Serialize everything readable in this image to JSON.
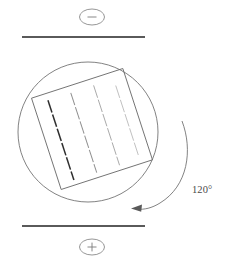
{
  "figure": {
    "background_color": "#ffffff",
    "width": 229,
    "height": 266
  },
  "electrodes": {
    "top": {
      "label": "negative-electrode",
      "terminal_symbol": "–",
      "terminal_symbol_name": "minus-sign",
      "plate_color": "#5a5a5a",
      "plate": {
        "x1": 22,
        "y1": 37,
        "x2": 145,
        "y2": 37
      },
      "terminal": {
        "cx": 92,
        "cy": 17,
        "rx": 12.5,
        "ry": 8
      }
    },
    "bottom": {
      "label": "positive-electrode",
      "terminal_symbol": "+",
      "terminal_symbol_name": "plus-sign",
      "plate_color": "#5a5a5a",
      "plate": {
        "x1": 22,
        "y1": 226,
        "x2": 145,
        "y2": 226
      },
      "terminal": {
        "cx": 92,
        "cy": 247,
        "rx": 12.5,
        "ry": 8
      }
    }
  },
  "cell": {
    "label": "cell-circle",
    "cx": 88,
    "cy": 132,
    "r": 70,
    "stroke_color": "#6b6b6b"
  },
  "sample": {
    "label": "rotated-sample-square",
    "cx": 92,
    "cy": 129,
    "size": 96,
    "rotation_deg": -18,
    "stroke_color": "#6b6b6b"
  },
  "director_field": {
    "label": "director-dashes",
    "column_count": 4,
    "dashes_per_column": 6,
    "columns": [
      {
        "index": 0,
        "color": "#2e2e2e",
        "width": 1.5
      },
      {
        "index": 1,
        "color": "#8e8e8e",
        "width": 1.0
      },
      {
        "index": 2,
        "color": "#a8a8a8",
        "width": 0.9
      },
      {
        "index": 3,
        "color": "#bcbcbc",
        "width": 0.85
      }
    ]
  },
  "rotation_indicator": {
    "label": "rotation-arc",
    "angle_label": "120°",
    "direction": "counterclockwise",
    "arrow_color": "#5a5a5a",
    "arc_color": "#6b6b6b",
    "text_position": {
      "x": 192,
      "y": 193
    }
  }
}
